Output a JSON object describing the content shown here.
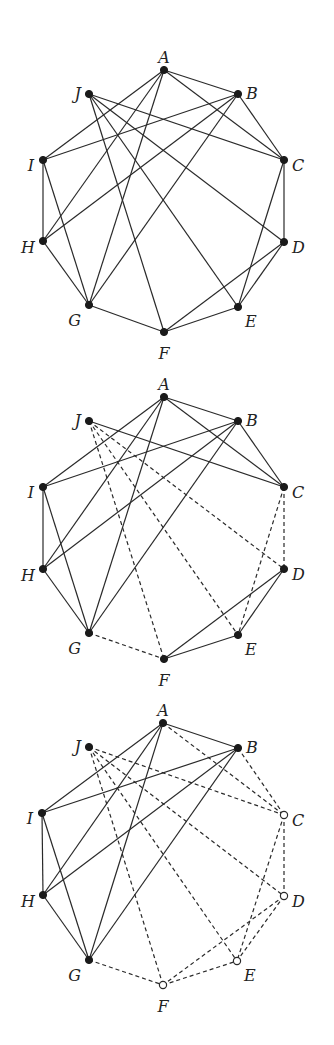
{
  "figure": {
    "node_radius": 3.6,
    "colors": {
      "stroke": "#2a2a2a",
      "node_fill": "#1a1a1a",
      "hollow_fill": "#ffffff",
      "background": "#ffffff"
    }
  },
  "graphs": [
    {
      "id": "graph-1",
      "nodes": [
        {
          "id": "A",
          "label": "A",
          "x": 164,
          "y": 70,
          "hollow": false,
          "lx": 164,
          "ly": 58,
          "anchor": "middle"
        },
        {
          "id": "B",
          "label": "B",
          "x": 238,
          "y": 94,
          "hollow": false,
          "lx": 246,
          "ly": 94,
          "anchor": "start"
        },
        {
          "id": "C",
          "label": "C",
          "x": 284,
          "y": 160,
          "hollow": false,
          "lx": 292,
          "ly": 166,
          "anchor": "start"
        },
        {
          "id": "D",
          "label": "D",
          "x": 284,
          "y": 242,
          "hollow": false,
          "lx": 292,
          "ly": 248,
          "anchor": "start"
        },
        {
          "id": "E",
          "label": "E",
          "x": 238,
          "y": 307,
          "hollow": false,
          "lx": 245,
          "ly": 322,
          "anchor": "start"
        },
        {
          "id": "F",
          "label": "F",
          "x": 164,
          "y": 332,
          "hollow": false,
          "lx": 164,
          "ly": 354,
          "anchor": "middle"
        },
        {
          "id": "G",
          "label": "G",
          "x": 89,
          "y": 305,
          "hollow": false,
          "lx": 81,
          "ly": 321,
          "anchor": "end"
        },
        {
          "id": "H",
          "label": "H",
          "x": 43,
          "y": 241,
          "hollow": false,
          "lx": 35,
          "ly": 248,
          "anchor": "end"
        },
        {
          "id": "I",
          "label": "I",
          "x": 43,
          "y": 160,
          "hollow": false,
          "lx": 34,
          "ly": 166,
          "anchor": "end"
        },
        {
          "id": "J",
          "label": "J",
          "x": 89,
          "y": 94,
          "hollow": false,
          "lx": 81,
          "ly": 94,
          "anchor": "end"
        }
      ],
      "edges": [
        {
          "from": "A",
          "to": "B",
          "dashed": false
        },
        {
          "from": "A",
          "to": "C",
          "dashed": false
        },
        {
          "from": "A",
          "to": "I",
          "dashed": false
        },
        {
          "from": "A",
          "to": "H",
          "dashed": false
        },
        {
          "from": "A",
          "to": "G",
          "dashed": false
        },
        {
          "from": "B",
          "to": "C",
          "dashed": false
        },
        {
          "from": "B",
          "to": "I",
          "dashed": false
        },
        {
          "from": "B",
          "to": "H",
          "dashed": false
        },
        {
          "from": "B",
          "to": "G",
          "dashed": false
        },
        {
          "from": "J",
          "to": "C",
          "dashed": false
        },
        {
          "from": "J",
          "to": "D",
          "dashed": false
        },
        {
          "from": "J",
          "to": "E",
          "dashed": false
        },
        {
          "from": "J",
          "to": "F",
          "dashed": false
        },
        {
          "from": "I",
          "to": "H",
          "dashed": false
        },
        {
          "from": "I",
          "to": "G",
          "dashed": false
        },
        {
          "from": "H",
          "to": "G",
          "dashed": false
        },
        {
          "from": "C",
          "to": "D",
          "dashed": false
        },
        {
          "from": "C",
          "to": "E",
          "dashed": false
        },
        {
          "from": "D",
          "to": "E",
          "dashed": false
        },
        {
          "from": "D",
          "to": "F",
          "dashed": false
        },
        {
          "from": "G",
          "to": "F",
          "dashed": false
        },
        {
          "from": "F",
          "to": "E",
          "dashed": false
        }
      ]
    },
    {
      "id": "graph-2",
      "nodes": [
        {
          "id": "A",
          "label": "A",
          "x": 164,
          "y": 397,
          "hollow": false,
          "lx": 164,
          "ly": 385,
          "anchor": "middle"
        },
        {
          "id": "B",
          "label": "B",
          "x": 238,
          "y": 421,
          "hollow": false,
          "lx": 246,
          "ly": 421,
          "anchor": "start"
        },
        {
          "id": "C",
          "label": "C",
          "x": 284,
          "y": 487,
          "hollow": false,
          "lx": 292,
          "ly": 493,
          "anchor": "start"
        },
        {
          "id": "D",
          "label": "D",
          "x": 284,
          "y": 569,
          "hollow": false,
          "lx": 292,
          "ly": 575,
          "anchor": "start"
        },
        {
          "id": "E",
          "label": "E",
          "x": 238,
          "y": 635,
          "hollow": false,
          "lx": 245,
          "ly": 650,
          "anchor": "start"
        },
        {
          "id": "F",
          "label": "F",
          "x": 164,
          "y": 659,
          "hollow": false,
          "lx": 164,
          "ly": 681,
          "anchor": "middle"
        },
        {
          "id": "G",
          "label": "G",
          "x": 89,
          "y": 633,
          "hollow": false,
          "lx": 81,
          "ly": 649,
          "anchor": "end"
        },
        {
          "id": "H",
          "label": "H",
          "x": 43,
          "y": 569,
          "hollow": false,
          "lx": 35,
          "ly": 576,
          "anchor": "end"
        },
        {
          "id": "I",
          "label": "I",
          "x": 43,
          "y": 487,
          "hollow": false,
          "lx": 34,
          "ly": 493,
          "anchor": "end"
        },
        {
          "id": "J",
          "label": "J",
          "x": 89,
          "y": 421,
          "hollow": false,
          "lx": 81,
          "ly": 421,
          "anchor": "end"
        }
      ],
      "edges": [
        {
          "from": "A",
          "to": "B",
          "dashed": false
        },
        {
          "from": "A",
          "to": "C",
          "dashed": false
        },
        {
          "from": "A",
          "to": "I",
          "dashed": false
        },
        {
          "from": "A",
          "to": "H",
          "dashed": false
        },
        {
          "from": "A",
          "to": "G",
          "dashed": false
        },
        {
          "from": "B",
          "to": "C",
          "dashed": false
        },
        {
          "from": "B",
          "to": "I",
          "dashed": false
        },
        {
          "from": "B",
          "to": "H",
          "dashed": false
        },
        {
          "from": "B",
          "to": "G",
          "dashed": false
        },
        {
          "from": "J",
          "to": "C",
          "dashed": false
        },
        {
          "from": "J",
          "to": "D",
          "dashed": true
        },
        {
          "from": "J",
          "to": "E",
          "dashed": true
        },
        {
          "from": "J",
          "to": "F",
          "dashed": true
        },
        {
          "from": "I",
          "to": "H",
          "dashed": false
        },
        {
          "from": "I",
          "to": "G",
          "dashed": false
        },
        {
          "from": "H",
          "to": "G",
          "dashed": false
        },
        {
          "from": "C",
          "to": "D",
          "dashed": true
        },
        {
          "from": "C",
          "to": "E",
          "dashed": true
        },
        {
          "from": "D",
          "to": "E",
          "dashed": false
        },
        {
          "from": "D",
          "to": "F",
          "dashed": false
        },
        {
          "from": "G",
          "to": "F",
          "dashed": true
        },
        {
          "from": "F",
          "to": "E",
          "dashed": false
        }
      ]
    },
    {
      "id": "graph-3",
      "nodes": [
        {
          "id": "A",
          "label": "A",
          "x": 163,
          "y": 723,
          "hollow": false,
          "lx": 163,
          "ly": 711,
          "anchor": "middle"
        },
        {
          "id": "B",
          "label": "B",
          "x": 238,
          "y": 748,
          "hollow": false,
          "lx": 246,
          "ly": 748,
          "anchor": "start"
        },
        {
          "id": "C",
          "label": "C",
          "x": 284,
          "y": 815,
          "hollow": true,
          "lx": 292,
          "ly": 821,
          "anchor": "start"
        },
        {
          "id": "D",
          "label": "D",
          "x": 284,
          "y": 896,
          "hollow": true,
          "lx": 292,
          "ly": 902,
          "anchor": "start"
        },
        {
          "id": "E",
          "label": "E",
          "x": 237,
          "y": 961,
          "hollow": true,
          "lx": 244,
          "ly": 976,
          "anchor": "start"
        },
        {
          "id": "F",
          "label": "F",
          "x": 163,
          "y": 985,
          "hollow": true,
          "lx": 163,
          "ly": 1007,
          "anchor": "middle"
        },
        {
          "id": "G",
          "label": "G",
          "x": 89,
          "y": 960,
          "hollow": false,
          "lx": 81,
          "ly": 976,
          "anchor": "end"
        },
        {
          "id": "H",
          "label": "H",
          "x": 43,
          "y": 895,
          "hollow": false,
          "lx": 35,
          "ly": 902,
          "anchor": "end"
        },
        {
          "id": "I",
          "label": "I",
          "x": 42,
          "y": 813,
          "hollow": false,
          "lx": 33,
          "ly": 819,
          "anchor": "end"
        },
        {
          "id": "J",
          "label": "J",
          "x": 89,
          "y": 747,
          "hollow": false,
          "lx": 81,
          "ly": 747,
          "anchor": "end"
        }
      ],
      "edges": [
        {
          "from": "A",
          "to": "B",
          "dashed": false
        },
        {
          "from": "A",
          "to": "C",
          "dashed": true
        },
        {
          "from": "A",
          "to": "I",
          "dashed": false
        },
        {
          "from": "A",
          "to": "H",
          "dashed": false
        },
        {
          "from": "A",
          "to": "G",
          "dashed": false
        },
        {
          "from": "B",
          "to": "C",
          "dashed": true
        },
        {
          "from": "B",
          "to": "I",
          "dashed": false
        },
        {
          "from": "B",
          "to": "H",
          "dashed": false
        },
        {
          "from": "B",
          "to": "G",
          "dashed": false
        },
        {
          "from": "J",
          "to": "C",
          "dashed": true
        },
        {
          "from": "J",
          "to": "D",
          "dashed": true
        },
        {
          "from": "J",
          "to": "E",
          "dashed": true
        },
        {
          "from": "J",
          "to": "F",
          "dashed": true
        },
        {
          "from": "I",
          "to": "H",
          "dashed": false
        },
        {
          "from": "I",
          "to": "G",
          "dashed": false
        },
        {
          "from": "H",
          "to": "G",
          "dashed": false
        },
        {
          "from": "C",
          "to": "D",
          "dashed": true
        },
        {
          "from": "C",
          "to": "E",
          "dashed": true
        },
        {
          "from": "D",
          "to": "E",
          "dashed": true
        },
        {
          "from": "D",
          "to": "F",
          "dashed": true
        },
        {
          "from": "G",
          "to": "F",
          "dashed": true
        },
        {
          "from": "F",
          "to": "E",
          "dashed": true
        }
      ]
    }
  ]
}
